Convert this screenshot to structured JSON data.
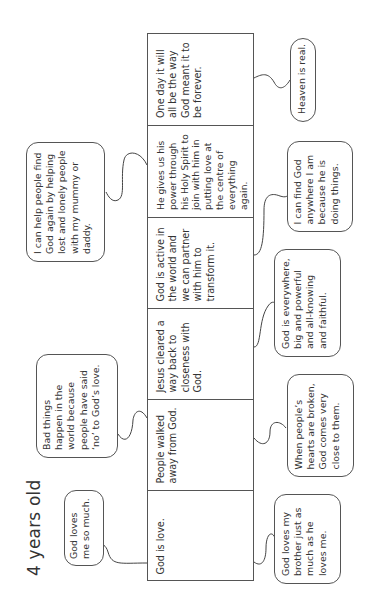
{
  "title": "4 years old",
  "stages": [
    {
      "text": "God is love."
    },
    {
      "text": "People walked away from God."
    },
    {
      "text": "Jesus cleared a way back to closeness with God."
    },
    {
      "text": "God is active in the world and we can partner with him to transform it."
    },
    {
      "text": "He gives us his power through his Holy Spirit to join with him in putting love at the centre of everything again."
    },
    {
      "text": "One day it will all be the way God meant it to be forever."
    }
  ],
  "left_bubbles": [
    {
      "text": "God loves me so much.",
      "stage": 1
    },
    {
      "text": "Bad things happen in the world because people have said ‘no’ to God’s love.",
      "stage": 2
    },
    {
      "text": "I can help people find God again by helping lost and lonely people with my mummy or daddy.",
      "stage": 5
    }
  ],
  "right_bubbles": [
    {
      "text": "God loves my brother just as much as he loves me.",
      "stage": 1
    },
    {
      "text": "When people’s hearts are broken, God comes very close to them.",
      "stage": 2
    },
    {
      "text": "God is everywhere, big and powerful and all-knowing and faithful.",
      "stage": 3
    },
    {
      "text": "I can find God anywhere I am because he is doing things.",
      "stage": 4
    },
    {
      "text": "Heaven is real.",
      "stage": 6
    }
  ]
}
